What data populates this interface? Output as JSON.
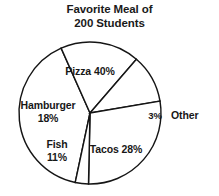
{
  "chart_data": {
    "type": "pie",
    "title": "Favorite Meal of 200 Students",
    "title_lines": [
      "Favorite Meal of",
      "200 Students"
    ],
    "total_students": 200,
    "categories": [
      "Pizza",
      "Hamburger",
      "Fish",
      "Tacos",
      "Other"
    ],
    "values": [
      40,
      18,
      11,
      28,
      3
    ],
    "value_unit": "percent",
    "counts": [
      80,
      36,
      22,
      56,
      6
    ],
    "labels": [
      "Pizza 40%",
      "Hamburger 18%",
      "Fish 11%",
      "Tacos 28%",
      "Other 3%"
    ],
    "legend": "none",
    "grid": false,
    "xlabel": "",
    "ylabel": "",
    "colors": {
      "slice_fill": "#ffffff",
      "slice_stroke": "#151515",
      "text": "#171717",
      "background": "#ffffff"
    },
    "geometry": {
      "center_x": 90,
      "center_y": 113,
      "radius": 71,
      "start_angle_deg": 192,
      "direction": "clockwise"
    }
  },
  "slices": {
    "pizza": {
      "label": "Pizza 40%",
      "name": "Pizza",
      "percent": "40%"
    },
    "hamburger": {
      "name": "Hamburger",
      "percent": "18%"
    },
    "fish": {
      "name": "Fish",
      "percent": "11%"
    },
    "tacos": {
      "label": "Tacos 28%",
      "name": "Tacos",
      "percent": "28%"
    },
    "other": {
      "name": "Other",
      "percent": "3%"
    }
  }
}
